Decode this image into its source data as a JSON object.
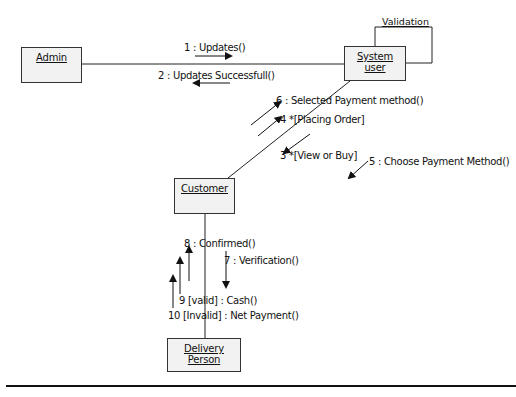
{
  "diagram": {
    "type": "UML collaboration diagram",
    "objects": [
      {
        "id": "admin",
        "label": "Admin"
      },
      {
        "id": "system_user",
        "label": "System user"
      },
      {
        "id": "customer",
        "label": "Customer"
      },
      {
        "id": "delivery_person",
        "label": "Delivery Person"
      }
    ],
    "self_loop": {
      "object": "system_user",
      "label": "Validation"
    },
    "messages": [
      {
        "seq": "1",
        "text": "1 : Updates()",
        "from": "admin",
        "to": "system_user"
      },
      {
        "seq": "2",
        "text": "2 : Updates Successfull()",
        "from": "system_user",
        "to": "admin"
      },
      {
        "seq": "3",
        "text": "3 *[View or Buy]",
        "from": "customer",
        "to": "system_user"
      },
      {
        "seq": "4",
        "text": "4 *[Placing Order]",
        "from": "customer",
        "to": "system_user"
      },
      {
        "seq": "5",
        "text": "5 : Choose Payment Method()",
        "from": "system_user",
        "to": "customer"
      },
      {
        "seq": "6",
        "text": "6 : Selected Payment method()",
        "from": "customer",
        "to": "system_user"
      },
      {
        "seq": "7",
        "text": "7 : Verification()",
        "from": "customer",
        "to": "delivery_person"
      },
      {
        "seq": "8",
        "text": "8 : Confirmed()",
        "from": "delivery_person",
        "to": "customer"
      },
      {
        "seq": "9",
        "text": "9 [valid] : Cash()",
        "from": "delivery_person",
        "to": "customer"
      },
      {
        "seq": "10",
        "text": "10 [Invalid] : Net Payment()",
        "from": "delivery_person",
        "to": "customer"
      }
    ]
  }
}
